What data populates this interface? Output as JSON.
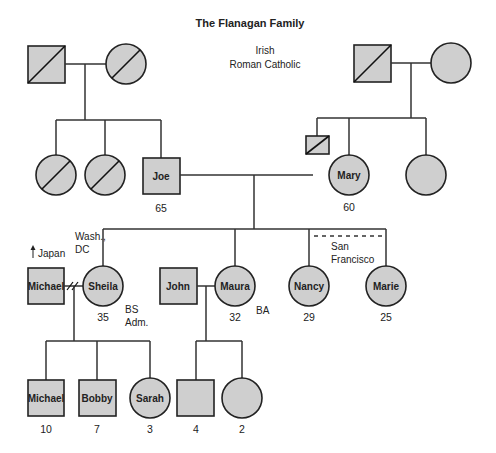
{
  "title": "The Flanagan Family",
  "heritage": {
    "ethnicity": "Irish",
    "religion": "Roman Catholic"
  },
  "colors": {
    "fill": "#cfcfcf",
    "stroke": "#222222",
    "background": "#ffffff"
  },
  "legend_semantics": {
    "square": "male",
    "circle": "female",
    "diagonal-slash": "deceased",
    "double-slash": "divorce",
    "dashed-line": "living together / close relationship"
  },
  "generation1": {
    "paternal_grandfather": {
      "shape": "square",
      "deceased": true,
      "name": ""
    },
    "paternal_grandmother": {
      "shape": "circle",
      "deceased": true,
      "name": ""
    },
    "maternal_grandfather": {
      "shape": "square",
      "deceased": true,
      "name": ""
    },
    "maternal_grandmother": {
      "shape": "circle",
      "deceased": false,
      "name": ""
    }
  },
  "generation2": {
    "paternal_aunt_1": {
      "shape": "circle",
      "deceased": true
    },
    "paternal_aunt_2": {
      "shape": "circle",
      "deceased": true
    },
    "joe": {
      "name": "Joe",
      "age": "65",
      "shape": "square"
    },
    "maternal_uncle": {
      "shape": "square",
      "deceased": true,
      "size": "small"
    },
    "mary": {
      "name": "Mary",
      "age": "60",
      "shape": "circle"
    },
    "maternal_aunt": {
      "shape": "circle",
      "deceased": false
    }
  },
  "generation3": {
    "michael_sr": {
      "name": "Michael",
      "shape": "square",
      "note": "Japan",
      "note_icon": "arrow-up"
    },
    "sheila": {
      "name": "Sheila",
      "age": "35",
      "shape": "circle",
      "location": [
        "Wash.,",
        "DC"
      ],
      "education": [
        "BS",
        "Adm."
      ]
    },
    "john": {
      "name": "John",
      "shape": "square"
    },
    "maura": {
      "name": "Maura",
      "age": "32",
      "shape": "circle",
      "education": "BA"
    },
    "nancy": {
      "name": "Nancy",
      "age": "29",
      "shape": "circle"
    },
    "marie": {
      "name": "Marie",
      "age": "25",
      "shape": "circle"
    },
    "nancy_marie_location": [
      "San",
      "Francisco"
    ]
  },
  "generation4": {
    "michael_jr": {
      "name": "Michael",
      "age": "10",
      "shape": "square"
    },
    "bobby": {
      "name": "Bobby",
      "age": "7",
      "shape": "square"
    },
    "sarah": {
      "name": "Sarah",
      "age": "3",
      "shape": "circle"
    },
    "maura_son": {
      "name": "",
      "age": "4",
      "shape": "square"
    },
    "maura_daughter": {
      "name": "",
      "age": "2",
      "shape": "circle"
    }
  }
}
